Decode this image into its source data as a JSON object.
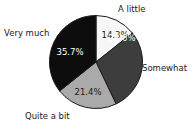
{
  "chart_data": {
    "type": "pie",
    "title": "",
    "subtitle": "",
    "xlabel": "",
    "ylabel": "",
    "legend_position": "none",
    "labels_position": "outside-callout",
    "grid": false,
    "start_angle_deg": 0,
    "direction": "clockwise",
    "categories": [
      "A little",
      "Somewhat",
      "Quite a bit",
      "Very much"
    ],
    "values": [
      14.3,
      28.6,
      21.4,
      35.7
    ],
    "value_suffix": "%",
    "slices": [
      {
        "label": "A little",
        "value": 14.3,
        "value_text": "14.3%",
        "color": "#f7f7f7",
        "stroke": "#1a1a1a",
        "label_color": "#1a1a1a",
        "start_deg": 0,
        "end_deg": 51.48
      },
      {
        "label": "Somewhat",
        "value": 28.6,
        "value_text": "28.6%",
        "color": "#3d3d3d",
        "stroke": "#1a1a1a",
        "label_color": "#ffffff",
        "start_deg": 51.48,
        "end_deg": 154.44
      },
      {
        "label": "Quite a bit",
        "value": 21.4,
        "value_text": "21.4%",
        "color": "#aaaaaa",
        "stroke": "#1a1a1a",
        "label_color": "#1a1a1a",
        "start_deg": 154.44,
        "end_deg": 231.48
      },
      {
        "label": "Very much",
        "value": 35.7,
        "value_text": "35.7%",
        "color": "#0d0d0d",
        "stroke": "#1a1a1a",
        "label_color": "#ffffff",
        "start_deg": 231.48,
        "end_deg": 360
      }
    ]
  },
  "colors": {
    "background": "#ffffff",
    "outline": "#1a1a1a",
    "text": "#1a1a1a",
    "slice_a_little": "#f7f7f7",
    "slice_somewhat": "#3d3d3d",
    "slice_quite_a_bit": "#aaaaaa",
    "slice_very_much": "#0d0d0d"
  }
}
